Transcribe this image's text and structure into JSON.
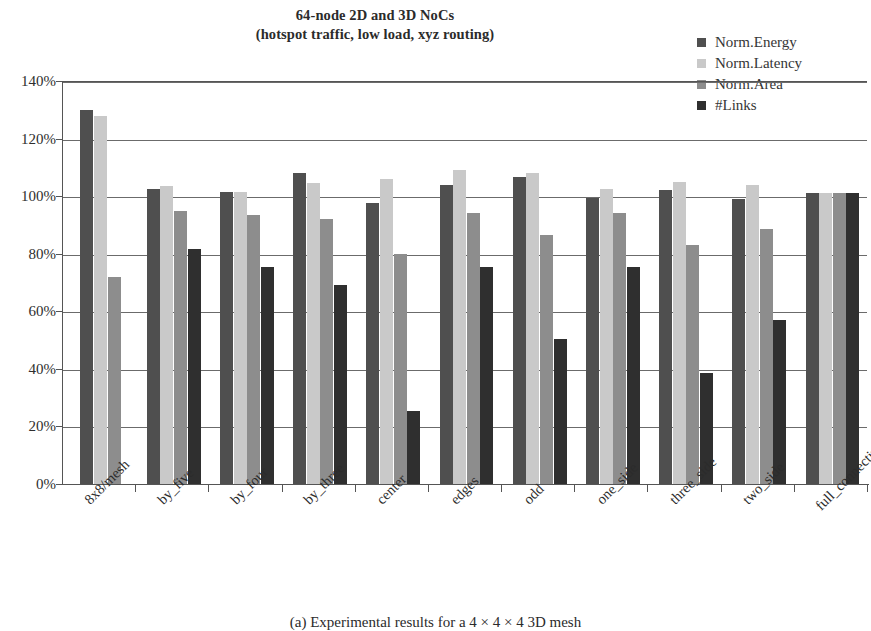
{
  "chart_data": {
    "type": "bar",
    "title": "64-node 2D and 3D NoCs",
    "subtitle": "(hotspot traffic, low load, xyz routing)",
    "xlabel": "",
    "ylabel": "",
    "ylim": [
      0,
      140
    ],
    "ytick_labels": [
      "0%",
      "20%",
      "40%",
      "60%",
      "80%",
      "100%",
      "120%",
      "140%"
    ],
    "ytick_values": [
      0,
      20,
      40,
      60,
      80,
      100,
      120,
      140
    ],
    "grid": true,
    "legend_position": "top-right",
    "categories": [
      "8x8/mesh",
      "by_five",
      "by_four",
      "by_three",
      "center",
      "edges",
      "odd",
      "one_side",
      "three_side",
      "two_side",
      "full_connectivity"
    ],
    "series": [
      {
        "name": "Norm.Energy",
        "color": "#4f4f4f",
        "values": [
          130,
          102.5,
          101.5,
          108,
          97.5,
          104,
          106.5,
          99.5,
          102,
          99,
          101
        ]
      },
      {
        "name": "Norm.Latency",
        "color": "#c9c9c9",
        "values": [
          128,
          103.5,
          101.5,
          104.5,
          106,
          109,
          108,
          102.5,
          105,
          104,
          101
        ]
      },
      {
        "name": "Norm.Area",
        "color": "#8d8d8d",
        "values": [
          72,
          95,
          93.5,
          92,
          80,
          94,
          86.5,
          94,
          83,
          88.5,
          101
        ]
      },
      {
        "name": "#Links",
        "color": "#2f2f2f",
        "values": [
          null,
          81.5,
          75.5,
          69,
          25.5,
          75.5,
          50.5,
          75.5,
          38.5,
          57,
          101
        ]
      }
    ]
  },
  "caption": "(a) Experimental results for a 4 × 4 × 4 3D mesh"
}
